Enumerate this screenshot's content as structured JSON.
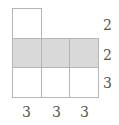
{
  "diagram": {
    "shade_color": "#d9d9d9",
    "line_color": "#b5b5b5",
    "row_labels": [
      "2",
      "2",
      "3"
    ],
    "column_labels": [
      "3",
      "3",
      "3"
    ],
    "rows": [
      {
        "cells": 1,
        "shaded": false,
        "height_label": "2"
      },
      {
        "cells": 3,
        "shaded": true,
        "height_label": "2"
      },
      {
        "cells": 3,
        "shaded": false,
        "height_label": "3"
      }
    ]
  }
}
